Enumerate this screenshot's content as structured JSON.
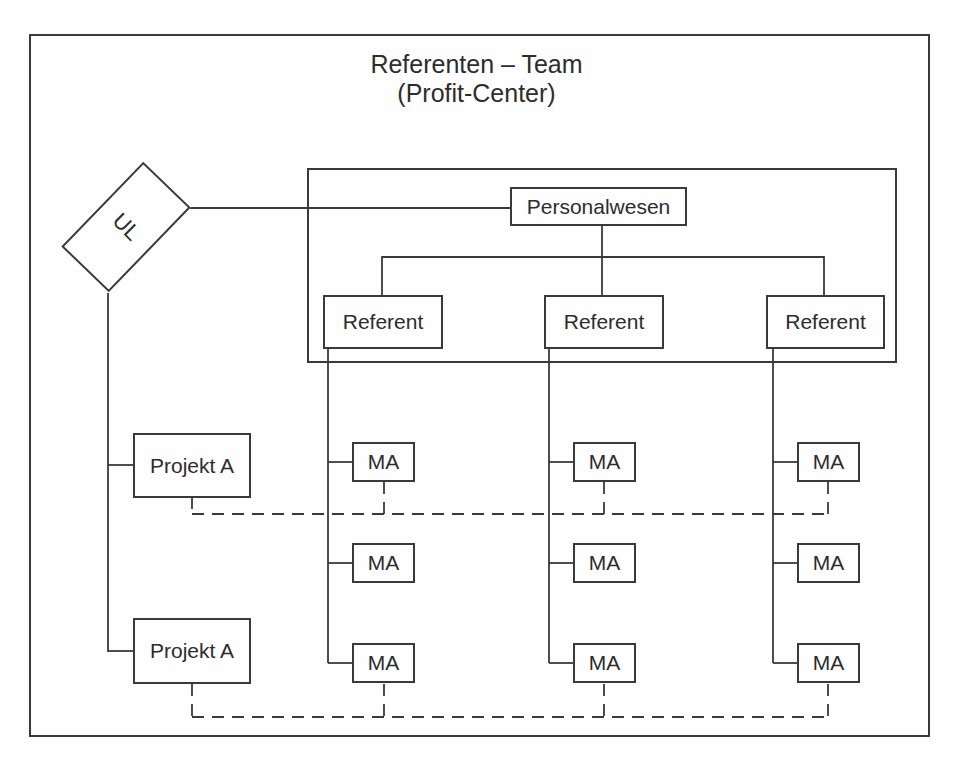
{
  "title": {
    "line1": "Referenten – Team",
    "line2": "(Profit-Center)"
  },
  "colors": {
    "line": "#3a3a3a",
    "background": "#fefefe",
    "text": "#2d2d2d"
  },
  "nodes": {
    "ul": {
      "label": "UL"
    },
    "personalwesen": {
      "label": "Personalwesen"
    },
    "referents": [
      {
        "label": "Referent"
      },
      {
        "label": "Referent"
      },
      {
        "label": "Referent"
      }
    ],
    "ma_columns": [
      {
        "rows": [
          "MA",
          "MA",
          "MA"
        ]
      },
      {
        "rows": [
          "MA",
          "MA",
          "MA"
        ]
      },
      {
        "rows": [
          "MA",
          "MA",
          "MA"
        ]
      }
    ],
    "projects": [
      {
        "label": "Projekt A"
      },
      {
        "label": "Projekt A"
      }
    ]
  }
}
